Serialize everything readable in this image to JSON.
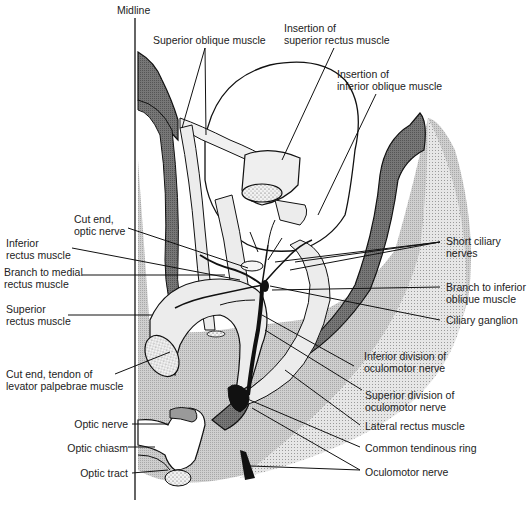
{
  "figure": {
    "type": "anatomical diagram",
    "colors": {
      "line": "#111111",
      "light_fill": "#d9d9d9",
      "medium_fill": "#bdbdbd",
      "dark_fill": "#6e6e6e",
      "black_fill": "#111111",
      "white": "#ffffff"
    }
  },
  "labels": {
    "midline": "Midline",
    "superior_oblique": "Superior oblique muscle",
    "insertion_superior_rectus": "Insertion of\nsuperior rectus muscle",
    "insertion_inferior_oblique": "Insertion of\ninferior oblique muscle",
    "cut_end_optic_nerve": "Cut end,\noptic nerve",
    "inferior_rectus": "Inferior\nrectus muscle",
    "branch_medial_rectus": "Branch to medial\nrectus muscle",
    "superior_rectus": "Superior\nrectus muscle",
    "cut_end_levator": "Cut end, tendon of\nlevator palpebrae muscle",
    "optic_nerve": "Optic nerve",
    "optic_chiasm": "Optic chiasm",
    "optic_tract": "Optic tract",
    "short_ciliary_nerves": "Short ciliary\nnerves",
    "branch_inferior_oblique": "Branch to inferior\noblique muscle",
    "ciliary_ganglion": "Ciliary ganglion",
    "inferior_division": "Inferior division of\noculomotor nerve",
    "superior_division": "Superior division of\noculomotor nerve",
    "lateral_rectus": "Lateral rectus muscle",
    "common_tendinous_ring": "Common tendinous ring",
    "oculomotor_nerve": "Oculomotor nerve"
  }
}
